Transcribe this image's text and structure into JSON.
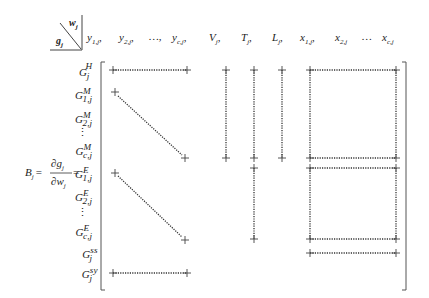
{
  "header": {
    "corner_top": "w",
    "corner_top_sub": "j",
    "corner_bottom": "g",
    "corner_bottom_sub": "j",
    "columns": [
      {
        "base": "y",
        "sub": "1,j",
        "sep": ","
      },
      {
        "base": "y",
        "sub": "2,j",
        "sep": ","
      },
      {
        "base": "…",
        "sub": "",
        "sep": ","
      },
      {
        "base": "y",
        "sub": "c,j",
        "sep": ","
      },
      {
        "base": "V",
        "sub": "j",
        "sep": ","
      },
      {
        "base": "T",
        "sub": "j",
        "sep": ","
      },
      {
        "base": "L",
        "sub": "j",
        "sep": ","
      },
      {
        "base": "x",
        "sub": "1,j",
        "sep": ","
      },
      {
        "base": "x",
        "sub": "2,j",
        "sep": ""
      },
      {
        "base": "…",
        "sub": "",
        "sep": ""
      },
      {
        "base": "x",
        "sub": "c,j",
        "sep": ""
      }
    ]
  },
  "equation": {
    "lhs": "B",
    "lhs_sub": "j",
    "equals": "=",
    "numerator": "∂g",
    "numerator_sub": "j",
    "denominator": "∂w",
    "denominator_sub": "j",
    "equals2": "="
  },
  "rows": [
    {
      "base": "G",
      "sub": "j",
      "sup": "H"
    },
    {
      "base": "G",
      "sub": "1,j",
      "sup": "M"
    },
    {
      "base": "G",
      "sub": "2,j",
      "sup": "M"
    },
    {
      "base": "⋮",
      "sub": "",
      "sup": ""
    },
    {
      "base": "G",
      "sub": "c,j",
      "sup": "M"
    },
    {
      "base": "G",
      "sub": "1,j",
      "sup": "E"
    },
    {
      "base": "G",
      "sub": "2,j",
      "sup": "E"
    },
    {
      "base": "⋮",
      "sub": "",
      "sup": ""
    },
    {
      "base": "G",
      "sub": "c,j",
      "sup": "E"
    },
    {
      "base": "G",
      "sub": "j",
      "sup": "ss"
    },
    {
      "base": "G",
      "sub": "j",
      "sup": "sy"
    }
  ],
  "colors": {
    "ink": "#222222",
    "dots": "#333333",
    "bracket": "#555555"
  }
}
